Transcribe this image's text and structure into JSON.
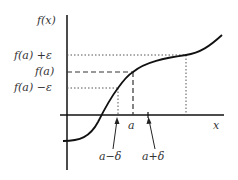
{
  "diagram": {
    "type": "epsilon-delta continuity illustration",
    "y_axis_label": "f(x)",
    "x_axis_label": "x",
    "y_labels": {
      "upper": "f(a) +ε",
      "center": "f(a)",
      "lower": "f(a) −ε"
    },
    "x_labels": {
      "a": "a",
      "a_minus_delta": "a−δ",
      "a_plus_delta": "a+δ"
    },
    "colors": {
      "curve": "#111111",
      "axes": "#111111",
      "guides": "#555555"
    }
  }
}
